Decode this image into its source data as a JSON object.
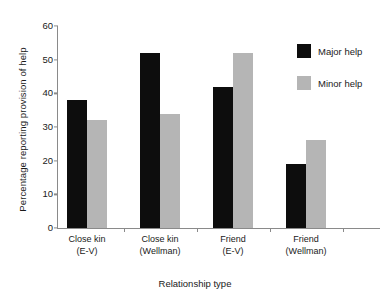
{
  "chart_data": {
    "type": "bar",
    "title": "",
    "xlabel": "Relationship type",
    "ylabel": "Percentage reporting provision of help",
    "categories": [
      {
        "line1": "Close kin",
        "line2": "(E-V)"
      },
      {
        "line1": "Close kin",
        "line2": "(Wellman)"
      },
      {
        "line1": "Friend",
        "line2": "(E-V)"
      },
      {
        "line1": "Friend",
        "line2": "(Wellman)"
      }
    ],
    "series": [
      {
        "name": "Major help",
        "color": "#0d0d0d",
        "values": [
          38,
          52,
          42,
          19
        ]
      },
      {
        "name": "Minor help",
        "color": "#b5b5b5",
        "values": [
          32,
          34,
          52,
          26
        ]
      }
    ],
    "ylim": [
      0,
      60
    ],
    "yticks": [
      0,
      10,
      20,
      30,
      40,
      50,
      60
    ],
    "ytick_labels": [
      "0",
      "10",
      "20",
      "30",
      "40",
      "50",
      "60"
    ],
    "grid": false,
    "legend_position": "right-top"
  },
  "legend": {
    "items": [
      {
        "label": "Major help",
        "swatch": "major"
      },
      {
        "label": "Minor help",
        "swatch": "minor"
      }
    ]
  }
}
